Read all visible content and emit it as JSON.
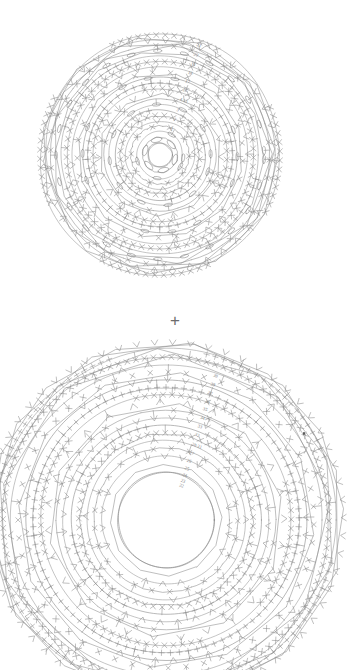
{
  "page": {
    "kind": "crochet-pattern-chart-sheet",
    "background_color": "#ffffff",
    "line_color": "#8a8a8a",
    "label_color": "#7b7b7b",
    "width": 350,
    "height": 658
  },
  "separator": {
    "symbol": "+",
    "name": "plus-separator"
  },
  "charts": [
    {
      "id": "chart-top",
      "title": "",
      "center": {
        "x": 160,
        "y": 155
      },
      "outer_radius": 120,
      "inner_hole_radius": 12,
      "round_labels": [
        "21",
        "20",
        "19",
        "18",
        "17",
        "16",
        "4-15",
        "3",
        "2",
        "1"
      ],
      "round_label_radii": [
        116,
        106,
        96,
        87,
        78,
        69,
        59,
        48,
        38,
        28
      ],
      "rings": 21,
      "symbols": [
        "x-stitch",
        "plus-stitch",
        "oval-bobble",
        "chain-arc",
        "v-stitch"
      ]
    },
    {
      "id": "chart-bottom",
      "title": "",
      "center": {
        "x": 166,
        "y": 520
      },
      "outer_radius": 178,
      "inner_hole_radius": 48,
      "round_labels": [
        "39",
        "38",
        "37",
        "36",
        "35",
        "34",
        "33",
        "32",
        "28-31",
        "27",
        "26",
        "25",
        "24",
        "23",
        "22"
      ],
      "round_label_radii": [
        152,
        143,
        134,
        125,
        117,
        108,
        99,
        90,
        80,
        71,
        63,
        55,
        48,
        42,
        37
      ],
      "rings": 18,
      "symbols": [
        "x-stitch",
        "plus-stitch",
        "v-stitch",
        "chain-arc",
        "triangle-cluster"
      ]
    }
  ],
  "chart_data": {
    "type": "diagram",
    "title": "",
    "subtitle": "",
    "charts": [
      {
        "name": "upper-motif-chart",
        "shape": "concentric-circles",
        "round_numbers": [
          "1",
          "2",
          "3",
          "4-15",
          "16",
          "17",
          "18",
          "19",
          "20",
          "21"
        ],
        "label_side": "right-of-vertical-axis",
        "stitch_symbols": [
          "X",
          "+",
          "oval",
          "arc",
          "V"
        ],
        "center_hole": true
      },
      {
        "name": "lower-motif-chart",
        "shape": "concentric-circles",
        "round_numbers": [
          "22",
          "23",
          "24",
          "25",
          "26",
          "27",
          "28-31",
          "32",
          "33",
          "34",
          "35",
          "36",
          "37",
          "38",
          "39"
        ],
        "label_side": "right-of-vertical-axis",
        "stitch_symbols": [
          "X",
          "+",
          "V",
          "arc",
          "triangle"
        ],
        "center_hole": true
      }
    ],
    "grid": false,
    "legend": []
  }
}
